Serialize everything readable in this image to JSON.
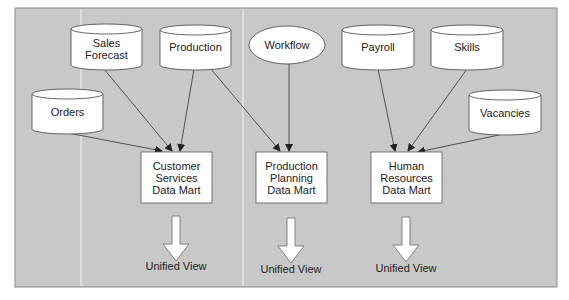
{
  "diagram": {
    "type": "data-mart-architecture",
    "background_color": "#c8c8c8",
    "sources": [
      {
        "id": "sales_forecast",
        "label": "Sales\nForecast",
        "shape": "cylinder"
      },
      {
        "id": "production",
        "label": "Production",
        "shape": "cylinder"
      },
      {
        "id": "workflow",
        "label": "Workflow",
        "shape": "ellipse"
      },
      {
        "id": "payroll",
        "label": "Payroll",
        "shape": "cylinder"
      },
      {
        "id": "skills",
        "label": "Skills",
        "shape": "cylinder"
      },
      {
        "id": "orders",
        "label": "Orders",
        "shape": "cylinder"
      },
      {
        "id": "vacancies",
        "label": "Vacancies",
        "shape": "cylinder"
      }
    ],
    "data_marts": [
      {
        "id": "customer_services",
        "label": "Customer\nServices\nData Mart",
        "output_label": "Unified View"
      },
      {
        "id": "production_planning",
        "label": "Production\nPlanning\nData Mart",
        "output_label": "Unified View"
      },
      {
        "id": "human_resources",
        "label": "Human\nResources\nData Mart",
        "output_label": "Unified View"
      }
    ],
    "edges": [
      {
        "from": "orders",
        "to": "customer_services"
      },
      {
        "from": "sales_forecast",
        "to": "customer_services"
      },
      {
        "from": "production",
        "to": "customer_services"
      },
      {
        "from": "production",
        "to": "production_planning"
      },
      {
        "from": "workflow",
        "to": "production_planning"
      },
      {
        "from": "payroll",
        "to": "human_resources"
      },
      {
        "from": "skills",
        "to": "human_resources"
      },
      {
        "from": "vacancies",
        "to": "human_resources"
      }
    ]
  }
}
